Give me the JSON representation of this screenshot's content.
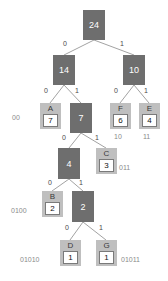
{
  "diagram": {
    "colors": {
      "internal_node": "#6e6e6e",
      "internal_text": "#ffffff",
      "leaf_outer": "#bfbfbf",
      "leaf_value_box": "#ffffff",
      "leaf_border": "#7a7a7a",
      "edge_line": "#8a8a8a",
      "edge_label": "#4a4a4a",
      "code_label": "#8a8a8a",
      "background": "#ffffff"
    }
  },
  "nodes": {
    "internal": [
      {
        "id": "root",
        "value": "24",
        "x": 83,
        "y": 10,
        "w": 22,
        "h": 30
      },
      {
        "id": "n14",
        "value": "14",
        "x": 53,
        "y": 55,
        "w": 22,
        "h": 30
      },
      {
        "id": "n10",
        "value": "10",
        "x": 123,
        "y": 55,
        "w": 22,
        "h": 30
      },
      {
        "id": "n7",
        "value": "7",
        "x": 70,
        "y": 103,
        "w": 22,
        "h": 30
      },
      {
        "id": "n4",
        "value": "4",
        "x": 58,
        "y": 148,
        "w": 22,
        "h": 31
      },
      {
        "id": "n2",
        "value": "2",
        "x": 72,
        "y": 191,
        "w": 22,
        "h": 31
      }
    ],
    "leaves": [
      {
        "id": "A",
        "letter": "A",
        "value": "7",
        "code": "00",
        "x": 40,
        "y": 103,
        "w": 21,
        "h": 26,
        "code_x": 12,
        "code_y": 114
      },
      {
        "id": "F",
        "letter": "F",
        "value": "6",
        "code": "10",
        "x": 110,
        "y": 103,
        "w": 21,
        "h": 26,
        "code_x": 114,
        "code_y": 133
      },
      {
        "id": "E",
        "letter": "E",
        "value": "4",
        "code": "11",
        "x": 139,
        "y": 103,
        "w": 21,
        "h": 26,
        "code_x": 143,
        "code_y": 133
      },
      {
        "id": "C",
        "letter": "C",
        "value": "3",
        "code": "011",
        "x": 96,
        "y": 148,
        "w": 21,
        "h": 26,
        "code_x": 119,
        "code_y": 164
      },
      {
        "id": "B",
        "letter": "B",
        "value": "2",
        "code": "0100",
        "x": 42,
        "y": 191,
        "w": 21,
        "h": 26,
        "code_x": 11,
        "code_y": 207
      },
      {
        "id": "D",
        "letter": "D",
        "value": "1",
        "code": "01010",
        "x": 60,
        "y": 240,
        "w": 21,
        "h": 26,
        "code_x": 20,
        "code_y": 256
      },
      {
        "id": "G",
        "letter": "G",
        "value": "1",
        "code": "01011",
        "x": 96,
        "y": 240,
        "w": 21,
        "h": 26,
        "code_x": 121,
        "code_y": 256
      }
    ]
  },
  "edges": [
    {
      "from": "root",
      "to": "n14",
      "bit": "0",
      "x1": 94,
      "y1": 40,
      "x2": 64,
      "y2": 55,
      "lx": 63,
      "ly": 40
    },
    {
      "from": "root",
      "to": "n10",
      "bit": "1",
      "x1": 94,
      "y1": 40,
      "x2": 134,
      "y2": 55,
      "lx": 120,
      "ly": 40
    },
    {
      "from": "n14",
      "to": "A",
      "bit": "0",
      "x1": 64,
      "y1": 85,
      "x2": 50,
      "y2": 103,
      "lx": 44,
      "ly": 87
    },
    {
      "from": "n14",
      "to": "n7",
      "bit": "1",
      "x1": 64,
      "y1": 85,
      "x2": 81,
      "y2": 103,
      "lx": 75,
      "ly": 87
    },
    {
      "from": "n10",
      "to": "F",
      "bit": "0",
      "x1": 134,
      "y1": 85,
      "x2": 120,
      "y2": 103,
      "lx": 114,
      "ly": 87
    },
    {
      "from": "n10",
      "to": "E",
      "bit": "1",
      "x1": 134,
      "y1": 85,
      "x2": 149,
      "y2": 103,
      "lx": 144,
      "ly": 87
    },
    {
      "from": "n7",
      "to": "n4",
      "bit": "0",
      "x1": 81,
      "y1": 133,
      "x2": 69,
      "y2": 148,
      "lx": 62,
      "ly": 134
    },
    {
      "from": "n7",
      "to": "C",
      "bit": "1",
      "x1": 81,
      "y1": 133,
      "x2": 106,
      "y2": 148,
      "lx": 95,
      "ly": 134
    },
    {
      "from": "n4",
      "to": "B",
      "bit": "0",
      "x1": 69,
      "y1": 179,
      "x2": 52,
      "y2": 191,
      "lx": 48,
      "ly": 179
    },
    {
      "from": "n4",
      "to": "n2",
      "bit": "1",
      "x1": 69,
      "y1": 179,
      "x2": 83,
      "y2": 191,
      "lx": 79,
      "ly": 179
    },
    {
      "from": "n2",
      "to": "D",
      "bit": "0",
      "x1": 83,
      "y1": 222,
      "x2": 70,
      "y2": 240,
      "lx": 65,
      "ly": 224
    },
    {
      "from": "n2",
      "to": "G",
      "bit": "1",
      "x1": 83,
      "y1": 222,
      "x2": 106,
      "y2": 240,
      "lx": 99,
      "ly": 224
    }
  ]
}
